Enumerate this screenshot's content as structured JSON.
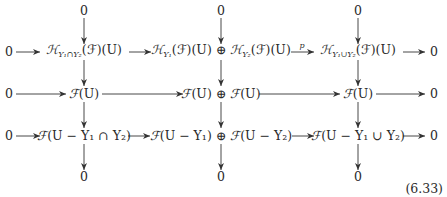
{
  "diagram": {
    "type": "commutative-diagram",
    "top_zeros": [
      "0",
      "0",
      "0"
    ],
    "bottom_zeros": [
      "0",
      "0",
      "0"
    ],
    "rows": [
      {
        "left": "0",
        "cells": [
          "𝓗_{Y₁∩Y₂}(𝓕)(U)",
          "𝓗_{Y₁}(𝓕)(U) ⊕ 𝓗_{Y₂}(𝓕)(U)",
          "𝓗_{Y₁∪Y₂}(𝓕)(U)"
        ],
        "right": "0",
        "arrow_labels": [
          "",
          "",
          "p",
          ""
        ]
      },
      {
        "left": "0",
        "cells": [
          "𝓕(U)",
          "𝓕(U) ⊕ 𝓕(U)",
          "𝓕(U)"
        ],
        "right": "0",
        "arrow_labels": [
          "",
          "",
          "",
          ""
        ]
      },
      {
        "left": "0",
        "cells": [
          "𝓕(U − Y₁ ∩ Y₂)",
          "𝓕(U − Y₁) ⊕ 𝓕(U − Y₂)",
          "𝓕(U − Y₁ ∪ Y₂)"
        ],
        "right": "0",
        "arrow_labels": [
          "",
          "",
          "",
          ""
        ]
      }
    ],
    "arrow_label_p": "p",
    "equation_number": "(6.33)"
  },
  "text": {
    "zero": "0",
    "H": "ℋ",
    "F": "ℱ",
    "U": "U",
    "paren_U": "(U)",
    "paren_F": "(ℱ)",
    "oplus": "⊕",
    "sub_cap": "Y₁∩Y₂",
    "sub_Y1": "Y₁",
    "sub_Y2": "Y₂",
    "sub_cup": "Y₁∪Y₂",
    "r3c1": "(U − Y₁ ∩ Y₂)",
    "r3c2a": "(U − Y₁)",
    "r3c2b": "(U − Y₂)",
    "r3c3": "(U − Y₁ ∪ Y₂)"
  }
}
